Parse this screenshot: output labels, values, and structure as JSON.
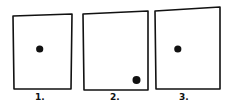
{
  "diagram": {
    "panels": [
      {
        "label": "1.",
        "dot": {
          "position": "center",
          "relative_x": 0.45,
          "relative_y": 0.46
        }
      },
      {
        "label": "2.",
        "dot": {
          "position": "bottom-right",
          "relative_x": 0.82,
          "relative_y": 0.87
        }
      },
      {
        "label": "3.",
        "dot": {
          "position": "center-left",
          "relative_x": 0.34,
          "relative_y": 0.5
        }
      }
    ],
    "colors": {
      "stroke": "#111111",
      "dot": "#111111",
      "background": "#ffffff"
    }
  }
}
